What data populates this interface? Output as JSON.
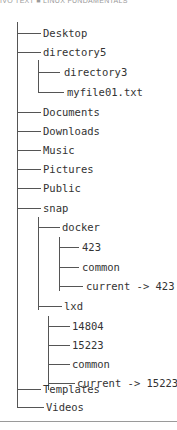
{
  "header": {
    "text": "IVO TEXT ■ LINUX FUNDAMENTALS"
  },
  "tree": {
    "items": [
      {
        "label": "Desktop",
        "depth": 0,
        "last": false
      },
      {
        "label": "directory5",
        "depth": 0,
        "last": false
      },
      {
        "label": "directory3",
        "depth": 1,
        "last": false
      },
      {
        "label": "myfile01.txt",
        "depth": 1,
        "last": true
      },
      {
        "label": "Documents",
        "depth": 0,
        "last": false
      },
      {
        "label": "Downloads",
        "depth": 0,
        "last": false
      },
      {
        "label": "Music",
        "depth": 0,
        "last": false
      },
      {
        "label": "Pictures",
        "depth": 0,
        "last": false
      },
      {
        "label": "Public",
        "depth": 0,
        "last": false
      },
      {
        "label": "snap",
        "depth": 0,
        "last": false
      },
      {
        "label": "docker",
        "depth": 1,
        "last": false
      },
      {
        "label": "423",
        "depth": 2,
        "last": false
      },
      {
        "label": "common",
        "depth": 2,
        "last": false
      },
      {
        "label": "current -> 423",
        "depth": 2,
        "last": true
      },
      {
        "label": "lxd",
        "depth": 1,
        "last": true
      },
      {
        "label": "14804",
        "depth": 2,
        "last": false
      },
      {
        "label": "15223",
        "depth": 2,
        "last": false
      },
      {
        "label": "common",
        "depth": 2,
        "last": false
      },
      {
        "label": "current -> 15223",
        "depth": 2,
        "last": true
      },
      {
        "label": "Templates",
        "depth": 0,
        "last": false
      },
      {
        "label": "Videos",
        "depth": 0,
        "last": true
      }
    ]
  }
}
